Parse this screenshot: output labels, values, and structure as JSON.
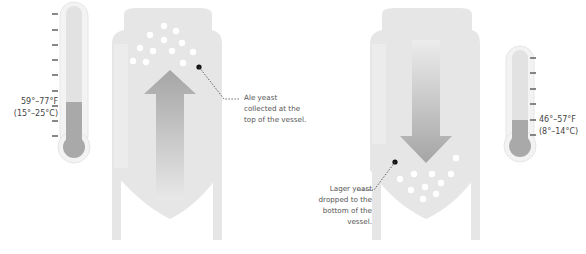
{
  "colors": {
    "tank_fill": "#e6e6e6",
    "tank_highlight": "#eeeeee",
    "arrow_fill": "#a8a8a8",
    "thermometer_tube": "#e2e2e2",
    "thermometer_liquid": "#a9a9a9",
    "yeast_dots": "#ffffff",
    "text": "#555555"
  },
  "ale": {
    "temperature_f": "59°–77°F",
    "temperature_c": "(15°–25°C)",
    "annotation_lines": [
      "Ale yeast",
      "collected at the",
      "top of the vessel."
    ],
    "arrow_direction": "up"
  },
  "lager": {
    "temperature_f": "46°–57°F",
    "temperature_c": "(8°–14°C)",
    "annotation_lines": [
      "Lager yeast",
      "dropped to the",
      "bottom of the",
      "vessel."
    ],
    "arrow_direction": "down"
  }
}
